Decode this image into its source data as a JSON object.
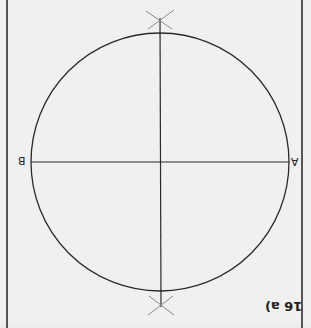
{
  "figure": {
    "label": "16 a)",
    "orientation": "rotated-180",
    "points": {
      "left": "B",
      "right": "A"
    },
    "circle": {
      "cx": 160,
      "cy": 162,
      "r": 129
    },
    "diameter_AB": {
      "x1": 31,
      "y1": 162,
      "x2": 289,
      "y2": 162
    },
    "perpendicular_bisector": {
      "x1": 160,
      "y1": 12,
      "x2": 161,
      "y2": 312
    },
    "arc_marks": [
      {
        "name": "top-intersection",
        "x": 160,
        "y": 19
      },
      {
        "name": "bottom-intersection",
        "x": 161,
        "y": 306
      }
    ],
    "colors": {
      "background": "#f0f0ef",
      "line": "#2a2a2a",
      "construction": "#8a8a8a",
      "border": "#555555"
    }
  }
}
